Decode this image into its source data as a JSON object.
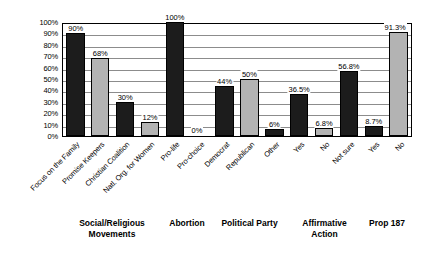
{
  "chart_data": {
    "type": "bar",
    "title": "",
    "subtitle": "",
    "xlabel": "",
    "ylabel": "",
    "ylim": [
      0,
      100
    ],
    "grid": true,
    "legend": "none",
    "value_suffix": "%",
    "y_ticks": [
      "100%",
      "90%",
      "80%",
      "70%",
      "60%",
      "50%",
      "40%",
      "30%",
      "20%",
      "10%",
      "0%"
    ],
    "y_tick_values": [
      100,
      90,
      80,
      70,
      60,
      50,
      40,
      30,
      20,
      10,
      0
    ],
    "categories": [
      "Focus on the Family",
      "Promise Keepers",
      "Christian Coalition",
      "Natl. Org. for Women",
      "Pro-life",
      "Pro-choice",
      "Democrat",
      "Republican",
      "Other",
      "Yes",
      "No",
      "Not sure",
      "Yes",
      "No"
    ],
    "values": [
      90,
      68,
      30,
      12,
      100,
      0,
      44,
      50,
      6,
      36.5,
      6.8,
      56.8,
      8.7,
      91.3
    ],
    "data_labels": [
      "90%",
      "68%",
      "30%",
      "12%",
      "100%",
      "0%",
      "44%",
      "50%",
      "6%",
      "36.5%",
      "6.8%",
      "56.8%",
      "8.7%",
      "91.3%"
    ],
    "bar_shades": [
      "dark",
      "light",
      "dark",
      "light",
      "dark",
      "light",
      "dark",
      "light",
      "dark",
      "dark",
      "light",
      "dark",
      "dark",
      "light"
    ],
    "groups": [
      {
        "label": "Social/Religious\nMovements",
        "start": 0,
        "count": 4
      },
      {
        "label": "Abortion",
        "start": 4,
        "count": 2
      },
      {
        "label": "Political Party",
        "start": 6,
        "count": 3
      },
      {
        "label": "Affirmative\nAction",
        "start": 9,
        "count": 3
      },
      {
        "label": "Prop 187",
        "start": 12,
        "count": 2
      }
    ],
    "colors": {
      "dark_bar": "#1c1c1c",
      "light_bar": "#b3b3b3",
      "gridline": "#8c8c8c",
      "axis": "#000000",
      "background": "#ffffff",
      "text": "#000000"
    }
  }
}
